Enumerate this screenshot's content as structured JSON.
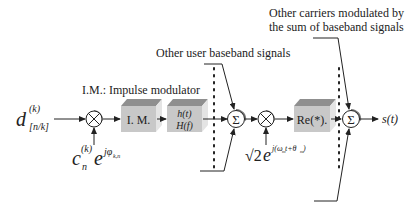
{
  "diagram": {
    "type": "block-diagram",
    "input": {
      "symbol": "d",
      "superscript": "(k)",
      "subscript": "[n/k]"
    },
    "spreading_input": {
      "symbol": "c",
      "superscript": "(k)",
      "subscript": "n",
      "exp_base": "e",
      "exp_power": "jφ",
      "exp_power_subscript": "k,n"
    },
    "blocks": [
      {
        "id": "impulse-modulator",
        "label": "I. M."
      },
      {
        "id": "pulse-shaping-filter",
        "line1": "h(t)",
        "line2": "H(f)"
      },
      {
        "id": "real-part",
        "label": "Re(*)."
      }
    ],
    "operators": {
      "multiplier_symbol": "⊗",
      "sum_symbol": "Σ"
    },
    "carrier_input": {
      "coefficient": "√2",
      "exp_base": "e",
      "exp_power": "j(ω",
      "omega_sub": "m",
      "mid": "t+θ",
      "theta_sub": "m",
      "close": ")"
    },
    "annotations": {
      "impulse_modulator_legend": "I.M.: Impulse modulator",
      "other_users": "Other user baseband signals",
      "other_carriers_line1": "Other carriers modulated by",
      "other_carriers_line2": "the sum of baseband signals"
    },
    "output": {
      "label": "s(t)"
    },
    "colors": {
      "line": "#222222",
      "box_front": "#c8c8c8",
      "box_top": "#8f8f8f",
      "box_side": "#e4e4e4",
      "shadow": "#7a7a7a"
    }
  }
}
